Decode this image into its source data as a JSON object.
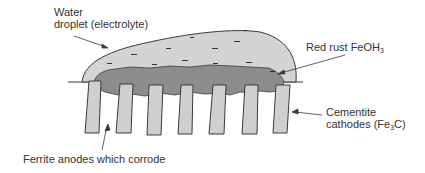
{
  "diagram": {
    "title": "",
    "labels": {
      "water_line1": "Water",
      "water_line2": "droplet (electrolyte)",
      "rust_main": "Red rust FeOH",
      "rust_sub": "3",
      "cementite_line1": "Cementite",
      "cementite_line2_pre": "cathodes (Fe",
      "cementite_line2_sub": "3",
      "cementite_line2_post": "C)",
      "ferrite": "Ferrite anodes which corrode"
    },
    "colors": {
      "droplet_fill": "#d4d4d4",
      "rust_fill": "#8c8c8c",
      "plate_fill": "#cfcfcf",
      "stroke": "#3a3a3a",
      "text": "#333333"
    },
    "plates_count": 7,
    "charge_symbol": "−"
  }
}
